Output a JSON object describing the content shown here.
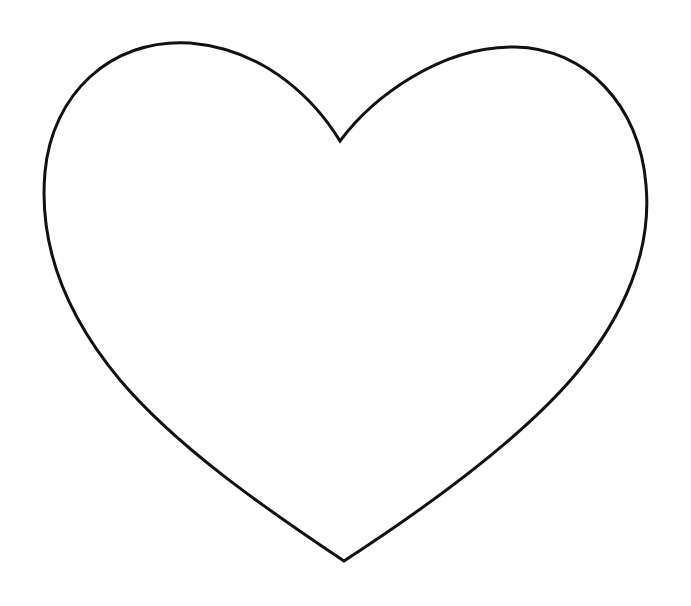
{
  "image": {
    "width": 691,
    "height": 606,
    "background": "#ffffff",
    "subject": "heart-outline"
  },
  "heart": {
    "stroke_color": "#111111",
    "stroke_width": 3,
    "fill": "none",
    "notch_point": [
      340,
      141
    ],
    "bottom_point": [
      344,
      561
    ],
    "left_extreme": [
      44,
      182
    ],
    "right_extreme": [
      646,
      192
    ],
    "left_lobe_top": [
      180,
      43
    ],
    "right_lobe_top": [
      515,
      47
    ]
  }
}
